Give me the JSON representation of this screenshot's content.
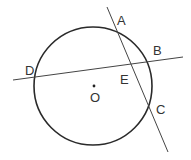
{
  "diagram": {
    "circle": {
      "cx": 93,
      "cy": 86,
      "r": 59,
      "center_label": "O"
    },
    "lines": [
      {
        "name": "line-AC",
        "x1": 107,
        "y1": 7,
        "x2": 168,
        "y2": 152
      },
      {
        "name": "line-DB",
        "x1": 13,
        "y1": 80,
        "x2": 183,
        "y2": 57
      }
    ],
    "points": {
      "A": "A",
      "B": "B",
      "C": "C",
      "D": "D",
      "E": "E",
      "O": "O"
    },
    "colors": {
      "stroke": "#333333",
      "circle_stroke": "#2a2a2a"
    }
  }
}
